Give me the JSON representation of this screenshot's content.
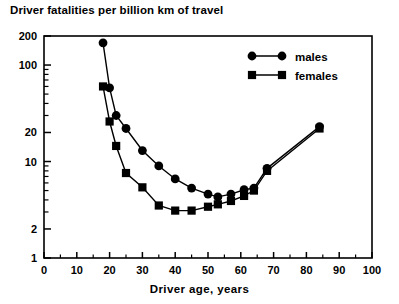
{
  "chart_data": {
    "type": "line",
    "title": "Driver fatalities per billion km of travel",
    "xlabel": "Driver age, years",
    "ylabel": "",
    "xlim": [
      0,
      100
    ],
    "ylim": [
      1,
      200
    ],
    "yscale": "log",
    "xscale": "linear",
    "grid": false,
    "legend_position": "top-right",
    "xticks": [
      0,
      10,
      20,
      30,
      40,
      50,
      60,
      70,
      80,
      90,
      100
    ],
    "xticklabels": [
      "0",
      "10",
      "20",
      "30",
      "40",
      "50",
      "60",
      "70",
      "80",
      "90",
      "100"
    ],
    "yticks": [
      1,
      2,
      10,
      20,
      100,
      200
    ],
    "yticklabels": [
      "1",
      "2",
      "10",
      "20",
      "100",
      "200"
    ],
    "yminorticks": [
      3,
      4,
      5,
      6,
      7,
      8,
      9,
      30,
      40,
      50,
      60,
      70,
      80,
      90
    ],
    "series": [
      {
        "name": "males",
        "marker": "circle",
        "color": "#000000",
        "points": [
          {
            "x": 18,
            "y": 170
          },
          {
            "x": 20,
            "y": 58
          },
          {
            "x": 22,
            "y": 30
          },
          {
            "x": 25,
            "y": 22
          },
          {
            "x": 30,
            "y": 13
          },
          {
            "x": 35,
            "y": 9.0
          },
          {
            "x": 40,
            "y": 6.6
          },
          {
            "x": 45,
            "y": 5.3
          },
          {
            "x": 50,
            "y": 4.6
          },
          {
            "x": 53,
            "y": 4.3
          },
          {
            "x": 57,
            "y": 4.6
          },
          {
            "x": 61,
            "y": 5.1
          },
          {
            "x": 64,
            "y": 5.3
          },
          {
            "x": 68,
            "y": 8.5
          },
          {
            "x": 84,
            "y": 23
          }
        ]
      },
      {
        "name": "females",
        "marker": "square",
        "color": "#000000",
        "points": [
          {
            "x": 18,
            "y": 60
          },
          {
            "x": 20,
            "y": 26
          },
          {
            "x": 22,
            "y": 14.5
          },
          {
            "x": 25,
            "y": 7.6
          },
          {
            "x": 30,
            "y": 5.4
          },
          {
            "x": 35,
            "y": 3.5
          },
          {
            "x": 40,
            "y": 3.1
          },
          {
            "x": 45,
            "y": 3.1
          },
          {
            "x": 50,
            "y": 3.4
          },
          {
            "x": 53,
            "y": 3.6
          },
          {
            "x": 57,
            "y": 3.9
          },
          {
            "x": 61,
            "y": 4.4
          },
          {
            "x": 64,
            "y": 5.0
          },
          {
            "x": 68,
            "y": 8.0
          },
          {
            "x": 84,
            "y": 22
          }
        ]
      }
    ],
    "legend": [
      {
        "label": "males",
        "marker": "circle"
      },
      {
        "label": "females",
        "marker": "square"
      }
    ]
  }
}
